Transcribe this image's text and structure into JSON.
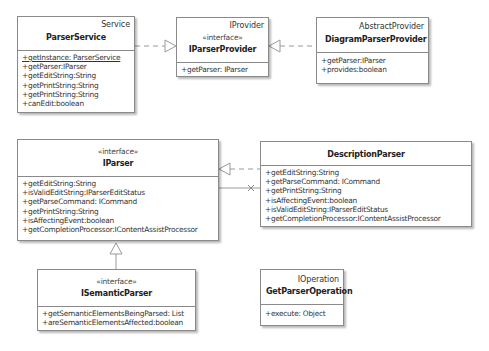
{
  "classes": {
    "parser_service": {
      "stereotype": "Service",
      "name": "ParserService",
      "ops": [
        "+getInstance: ParserService",
        "+getParser:IParser",
        "+getEditString:String",
        "+getPrintString:String",
        "+getPrintString:String",
        "+canEdit:boolean"
      ]
    },
    "iparser_provider": {
      "implements": "IProvider",
      "stereotype": "«interface»",
      "name": "IParserProvider",
      "ops": [
        "+getParser: IParser"
      ]
    },
    "diagram_parser_provider": {
      "extends": "AbstractProvider",
      "name": "DiagramParserProvider",
      "ops": [
        "+getParser:IParser",
        "+provides:boolean"
      ]
    },
    "iparser": {
      "stereotype": "«interface»",
      "name": "IParser",
      "ops": [
        "+getEditString:String",
        "+isValidEditString:IParserEditStatus",
        "+getParseCommand: ICommand",
        "+getPrintString:String",
        "+isAffectingEvent:boolean",
        "+getCompletionProcessor:IContentAssistProcessor"
      ]
    },
    "description_parser": {
      "name": "DescriptionParser",
      "ops": [
        "+getEditString:String",
        "+getParseCommand: ICommand",
        "+getPrintString:String",
        "+isAffectingEvent:boolean",
        "+isValidEditString:IParserEditStatus",
        "+getCompletionProcessor:IContentAssistProcessor"
      ]
    },
    "isemantic_parser": {
      "stereotype": "«interface»",
      "name": "ISemanticParser",
      "ops": [
        "+getSemanticElementsBeingParsed: List",
        "+areSemanticElementsAffected:boolean"
      ]
    },
    "get_parser_operation": {
      "implements": "IOperation",
      "name": "GetParserOperation",
      "ops": [
        "+execute: Object"
      ]
    }
  },
  "relations": [
    {
      "from": "ParserService",
      "to": "IParserProvider",
      "type": "realization"
    },
    {
      "from": "DiagramParserProvider",
      "to": "IParserProvider",
      "type": "realization"
    },
    {
      "from": "DescriptionParser",
      "to": "IParser",
      "type": "realization"
    },
    {
      "from": "DescriptionParser",
      "to": "IParser",
      "type": "association-non-navigable"
    },
    {
      "from": "ISemanticParser",
      "to": "IParser",
      "type": "generalization"
    }
  ],
  "colors": {
    "border": "#8a8a8a",
    "line": "#9a9a9a",
    "background": "#ffffff"
  }
}
